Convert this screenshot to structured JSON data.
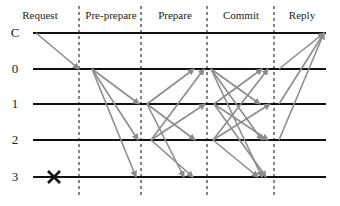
{
  "phases": [
    {
      "label": "Request",
      "x": 40
    },
    {
      "label": "Pre-prepare",
      "x": 110
    },
    {
      "label": "Prepare",
      "x": 174
    },
    {
      "label": "Commit",
      "x": 240
    },
    {
      "label": "Reply",
      "x": 300
    }
  ],
  "nodes": [
    {
      "label": "C",
      "y": 33
    },
    {
      "label": "0",
      "y": 69
    },
    {
      "label": "1",
      "y": 104
    },
    {
      "label": "2",
      "y": 140
    },
    {
      "label": "3",
      "y": 177
    }
  ],
  "phase_boundaries_x": [
    79,
    141,
    207,
    274
  ],
  "faulty_node": {
    "label": "3",
    "marker": "x-mark",
    "x": 54,
    "y": 177
  },
  "colors": {
    "timeline": "#111111",
    "arrow": "#8c8c8c",
    "boundary": "#333333",
    "fault": "#111111"
  },
  "messages": [
    {
      "phase": "Request",
      "from": "C",
      "to": "0",
      "x1": 36,
      "y1": 33,
      "x2": 79,
      "y2": 69
    },
    {
      "phase": "Pre-prepare",
      "from": "0",
      "to": "1",
      "x1": 92,
      "y1": 69,
      "x2": 139,
      "y2": 104
    },
    {
      "phase": "Pre-prepare",
      "from": "0",
      "to": "2",
      "x1": 92,
      "y1": 69,
      "x2": 138,
      "y2": 140
    },
    {
      "phase": "Pre-prepare",
      "from": "0",
      "to": "3",
      "x1": 92,
      "y1": 69,
      "x2": 136,
      "y2": 177
    },
    {
      "phase": "Prepare",
      "from": "1",
      "to": "0",
      "x1": 147,
      "y1": 104,
      "x2": 194,
      "y2": 69
    },
    {
      "phase": "Prepare",
      "from": "1",
      "to": "2",
      "x1": 147,
      "y1": 104,
      "x2": 195,
      "y2": 140
    },
    {
      "phase": "Prepare",
      "from": "1",
      "to": "3",
      "x1": 147,
      "y1": 104,
      "x2": 184,
      "y2": 177
    },
    {
      "phase": "Prepare",
      "from": "2",
      "to": "0",
      "x1": 151,
      "y1": 140,
      "x2": 204,
      "y2": 69
    },
    {
      "phase": "Prepare",
      "from": "2",
      "to": "1",
      "x1": 151,
      "y1": 140,
      "x2": 205,
      "y2": 104
    },
    {
      "phase": "Prepare",
      "from": "2",
      "to": "3",
      "x1": 151,
      "y1": 140,
      "x2": 193,
      "y2": 177
    },
    {
      "phase": "Commit",
      "from": "0",
      "to": "1",
      "x1": 211,
      "y1": 69,
      "x2": 260,
      "y2": 104
    },
    {
      "phase": "Commit",
      "from": "0",
      "to": "2",
      "x1": 211,
      "y1": 69,
      "x2": 262,
      "y2": 140
    },
    {
      "phase": "Commit",
      "from": "0",
      "to": "3",
      "x1": 211,
      "y1": 69,
      "x2": 262,
      "y2": 177
    },
    {
      "phase": "Commit",
      "from": "1",
      "to": "0",
      "x1": 214,
      "y1": 104,
      "x2": 262,
      "y2": 69
    },
    {
      "phase": "Commit",
      "from": "1",
      "to": "2",
      "x1": 214,
      "y1": 104,
      "x2": 268,
      "y2": 140
    },
    {
      "phase": "Commit",
      "from": "1",
      "to": "3",
      "x1": 214,
      "y1": 104,
      "x2": 266,
      "y2": 177
    },
    {
      "phase": "Commit",
      "from": "2",
      "to": "0",
      "x1": 213,
      "y1": 140,
      "x2": 268,
      "y2": 69
    },
    {
      "phase": "Commit",
      "from": "2",
      "to": "1",
      "x1": 213,
      "y1": 140,
      "x2": 270,
      "y2": 104
    },
    {
      "phase": "Commit",
      "from": "2",
      "to": "3",
      "x1": 213,
      "y1": 140,
      "x2": 258,
      "y2": 177
    },
    {
      "phase": "Reply",
      "from": "0",
      "to": "C",
      "x1": 279,
      "y1": 69,
      "x2": 324,
      "y2": 33
    },
    {
      "phase": "Reply",
      "from": "1",
      "to": "C",
      "x1": 279,
      "y1": 104,
      "x2": 324,
      "y2": 33
    },
    {
      "phase": "Reply",
      "from": "2",
      "to": "C",
      "x1": 279,
      "y1": 140,
      "x2": 324,
      "y2": 33
    }
  ]
}
